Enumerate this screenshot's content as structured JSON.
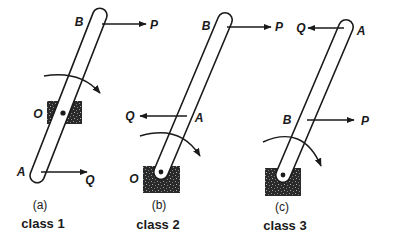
{
  "diagram": {
    "type": "lever-classes",
    "colors": {
      "ink": "#1a1a1a",
      "background": "#ffffff",
      "block": "#2a2a2a"
    },
    "panels": [
      {
        "id": "a",
        "caption": "(a)",
        "class_label": "class 1",
        "labels": {
          "top_end": "B",
          "top_force": "P",
          "fulcrum": "O",
          "bottom_end": "A",
          "bottom_force": "Q"
        }
      },
      {
        "id": "b",
        "caption": "(b)",
        "class_label": "class 2",
        "labels": {
          "top_end": "B",
          "top_force": "P",
          "mid_point": "A",
          "mid_force": "Q",
          "fulcrum": "O"
        }
      },
      {
        "id": "c",
        "caption": "(c)",
        "class_label": "class 3",
        "labels": {
          "top_end": "A",
          "top_force": "Q",
          "mid_point": "B",
          "mid_force": "P"
        }
      }
    ]
  }
}
